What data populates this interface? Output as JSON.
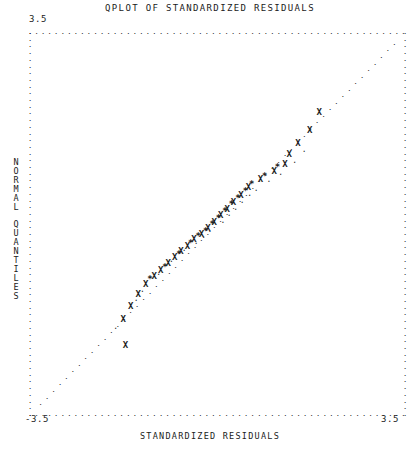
{
  "chart_data": {
    "type": "scatter",
    "title": "QPLOT OF STANDARDIZED RESIDUALS",
    "xlabel": "STANDARDIZED RESIDUALS",
    "ylabel": "NORMAL QUANTILES",
    "xlim": [
      -3.5,
      3.5
    ],
    "ylim": [
      -3.5,
      3.5
    ],
    "grid": false,
    "legend": null,
    "x_tick_labels": [
      "-3.5",
      "3.5"
    ],
    "y_tick_labels": [
      "-3.5",
      "3.5"
    ],
    "axis_style": "dotted-frame",
    "marker_glyphs": {
      "x": "X",
      "star": "*",
      "dot": "."
    },
    "series": [
      {
        "name": "reference-line",
        "glyph": ".",
        "description": "45-degree reference diagonal of fine dots",
        "points": [
          [
            -3.3,
            -3.3
          ],
          [
            -3.18,
            -3.18
          ],
          [
            -3.06,
            -3.06
          ],
          [
            -2.94,
            -2.94
          ],
          [
            -2.82,
            -2.82
          ],
          [
            -2.7,
            -2.7
          ],
          [
            -2.58,
            -2.58
          ],
          [
            -2.46,
            -2.46
          ],
          [
            -2.34,
            -2.34
          ],
          [
            -2.22,
            -2.22
          ],
          [
            -2.1,
            -2.1
          ],
          [
            -1.98,
            -1.98
          ],
          [
            -1.86,
            -1.86
          ],
          [
            -1.74,
            -1.74
          ],
          [
            -1.62,
            -1.62
          ],
          [
            -1.5,
            -1.5
          ],
          [
            -1.38,
            -1.38
          ],
          [
            -1.26,
            -1.26
          ],
          [
            -1.14,
            -1.14
          ],
          [
            -1.02,
            -1.02
          ],
          [
            -0.9,
            -0.9
          ],
          [
            -0.78,
            -0.78
          ],
          [
            -0.66,
            -0.66
          ],
          [
            -0.54,
            -0.54
          ],
          [
            -0.42,
            -0.42
          ],
          [
            -0.3,
            -0.3
          ],
          [
            -0.18,
            -0.18
          ],
          [
            -0.06,
            -0.06
          ],
          [
            0.06,
            0.06
          ],
          [
            0.18,
            0.18
          ],
          [
            0.3,
            0.3
          ],
          [
            0.42,
            0.42
          ],
          [
            0.54,
            0.54
          ],
          [
            0.66,
            0.66
          ],
          [
            0.78,
            0.78
          ],
          [
            0.9,
            0.9
          ],
          [
            1.02,
            1.02
          ],
          [
            1.14,
            1.14
          ],
          [
            1.26,
            1.26
          ],
          [
            1.38,
            1.38
          ],
          [
            1.5,
            1.5
          ],
          [
            1.62,
            1.62
          ],
          [
            1.74,
            1.74
          ],
          [
            1.86,
            1.86
          ],
          [
            1.98,
            1.98
          ],
          [
            2.1,
            2.1
          ],
          [
            2.22,
            2.22
          ],
          [
            2.34,
            2.34
          ],
          [
            2.46,
            2.46
          ],
          [
            2.58,
            2.58
          ],
          [
            2.7,
            2.7
          ],
          [
            2.82,
            2.82
          ],
          [
            2.94,
            2.94
          ],
          [
            3.06,
            3.06
          ],
          [
            3.18,
            3.18
          ],
          [
            3.3,
            3.3
          ]
        ]
      },
      {
        "name": "observed-quantiles-x",
        "glyph": "X",
        "description": "Primary observed data markers",
        "points": [
          [
            -1.72,
            -2.24
          ],
          [
            -1.76,
            -1.76
          ],
          [
            -1.62,
            -1.52
          ],
          [
            -1.48,
            -1.3
          ],
          [
            -1.34,
            -1.12
          ],
          [
            -1.18,
            -0.98
          ],
          [
            -1.06,
            -0.86
          ],
          [
            -0.92,
            -0.74
          ],
          [
            -0.8,
            -0.62
          ],
          [
            -0.68,
            -0.52
          ],
          [
            -0.56,
            -0.42
          ],
          [
            -0.44,
            -0.3
          ],
          [
            -0.3,
            -0.2
          ],
          [
            -0.18,
            -0.1
          ],
          [
            -0.06,
            0.02
          ],
          [
            0.06,
            0.14
          ],
          [
            0.18,
            0.26
          ],
          [
            0.3,
            0.38
          ],
          [
            0.44,
            0.52
          ],
          [
            0.58,
            0.66
          ],
          [
            0.8,
            0.8
          ],
          [
            1.06,
            0.96
          ],
          [
            1.26,
            1.08
          ],
          [
            1.34,
            1.26
          ],
          [
            1.5,
            1.46
          ],
          [
            1.72,
            1.7
          ],
          [
            1.9,
            2.04
          ]
        ]
      },
      {
        "name": "observed-quantiles-star",
        "glyph": "*",
        "description": "Secondary observed data markers",
        "points": [
          [
            -1.26,
            -1.02
          ],
          [
            -0.98,
            -0.8
          ],
          [
            -0.72,
            -0.56
          ],
          [
            -0.5,
            -0.36
          ],
          [
            -0.36,
            -0.24
          ],
          [
            -0.22,
            -0.14
          ],
          [
            -0.1,
            -0.02
          ],
          [
            0.02,
            0.1
          ],
          [
            0.14,
            0.22
          ],
          [
            0.26,
            0.34
          ],
          [
            0.38,
            0.46
          ],
          [
            0.52,
            0.58
          ],
          [
            0.64,
            0.72
          ],
          [
            0.88,
            0.86
          ],
          [
            1.12,
            1.02
          ]
        ]
      },
      {
        "name": "observed-quantiles-dot",
        "glyph": ".",
        "description": "Tertiary small observed markers offset from the X markers",
        "points": [
          [
            -1.9,
            -1.9
          ],
          [
            -1.52,
            -1.4
          ],
          [
            -1.4,
            -1.22
          ],
          [
            -1.1,
            -0.92
          ],
          [
            -0.86,
            -0.68
          ],
          [
            -0.62,
            -0.48
          ],
          [
            -0.4,
            -0.34
          ],
          [
            -0.26,
            -0.24
          ],
          [
            -0.14,
            -0.12
          ],
          [
            0.1,
            0.04
          ],
          [
            0.22,
            0.16
          ],
          [
            0.34,
            0.28
          ],
          [
            0.46,
            0.4
          ],
          [
            0.6,
            0.54
          ],
          [
            0.72,
            0.62
          ],
          [
            0.96,
            0.78
          ],
          [
            1.18,
            0.92
          ],
          [
            1.44,
            1.14
          ],
          [
            1.62,
            1.34
          ]
        ]
      }
    ]
  },
  "labels": {
    "title": "QPLOT OF STANDARDIZED RESIDUALS",
    "xaxis": "STANDARDIZED RESIDUALS",
    "yaxis_chars": [
      "N",
      "O",
      "R",
      "M",
      "A",
      "L",
      "",
      "Q",
      "U",
      "A",
      "N",
      "T",
      "I",
      "L",
      "E",
      "S"
    ],
    "tick_top_left": "3.5",
    "tick_bottom_left": "-3.5",
    "tick_bottom_right": "3.5"
  },
  "colors": {
    "background": "#ffffff",
    "ink": "#1d1d1d",
    "text": "#1b1b1b"
  }
}
